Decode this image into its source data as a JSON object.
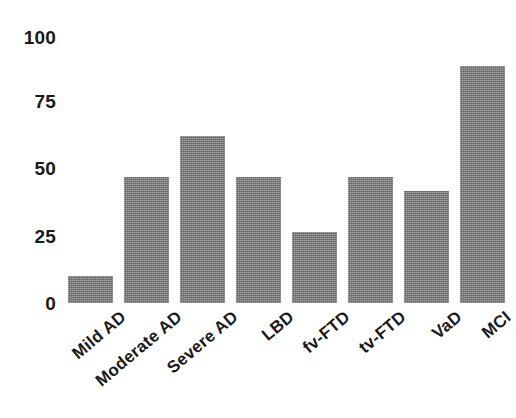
{
  "chart_data": {
    "type": "bar",
    "title": "",
    "subtitle": "",
    "xlabel": "",
    "ylabel": "",
    "categories": [
      "Mild AD",
      "Moderate AD",
      "Severe AD",
      "LBD",
      "fv-FTD",
      "tv-FTD",
      "VaD",
      "MCI"
    ],
    "values": [
      10,
      46,
      61,
      46,
      26,
      46,
      41,
      87
    ],
    "ylim": [
      0,
      100
    ],
    "yticks": [
      0,
      25,
      50,
      75,
      100
    ],
    "ytick_labels": [
      "0",
      "25",
      "50",
      "75",
      "100"
    ],
    "xtick_labels": [
      "Mild AD",
      "Moderate AD",
      "Severe AD",
      "LBD",
      "fv-FTD",
      "tv-FTD",
      "VaD",
      "MCI"
    ],
    "grid": false,
    "legend": false,
    "legend_position": "none",
    "annotations": [],
    "series": [
      {
        "name": "",
        "values": [
          10,
          46,
          61,
          46,
          26,
          46,
          41,
          87
        ]
      }
    ],
    "bar_color": "#7c7c7c",
    "background_color": "#ffffff",
    "text_color": "#1a1a1a",
    "xtick_rotation": -40
  }
}
